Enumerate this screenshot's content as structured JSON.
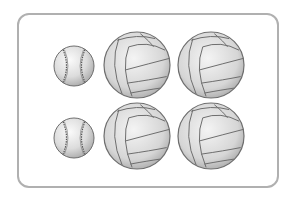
{
  "scene": {
    "frame": {
      "border_color": "#b0b0b0",
      "background": "#ffffff"
    },
    "rows": [
      {
        "items": [
          {
            "type": "baseball",
            "cx": 74,
            "cy": 66,
            "r": 20
          },
          {
            "type": "volleyball",
            "cx": 137,
            "cy": 65,
            "r": 33
          },
          {
            "type": "volleyball",
            "cx": 211,
            "cy": 65,
            "r": 33
          }
        ]
      },
      {
        "items": [
          {
            "type": "baseball",
            "cx": 74,
            "cy": 138,
            "r": 20
          },
          {
            "type": "volleyball",
            "cx": 137,
            "cy": 136,
            "r": 33
          },
          {
            "type": "volleyball",
            "cx": 211,
            "cy": 136,
            "r": 33
          }
        ]
      }
    ],
    "counts": {
      "baseball": 2,
      "volleyball": 4
    },
    "colors": {
      "ball_light": "#f2f2f2",
      "ball_mid": "#d4d4d4",
      "ball_dark": "#9a9a9a",
      "outline": "#6e6e6e",
      "stitch": "#555555"
    }
  }
}
